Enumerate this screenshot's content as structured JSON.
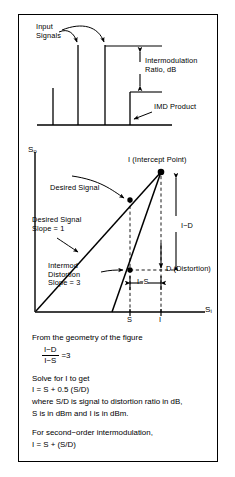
{
  "figure": {
    "ink_color": "#000000",
    "background_color": "#ffffff"
  },
  "spectrum_panel": {
    "name": "input spectrum with intermodulation products",
    "annotations": {
      "input_signals": "Input\nSignals",
      "intermodulation_ratio": "Intermodulation\nRatio, dB",
      "imd_product": "IMD Product"
    },
    "spikes": [
      {
        "label": "low-level spur",
        "relative_height": 0.36
      },
      {
        "label": "input signal 1",
        "relative_height": 0.93
      },
      {
        "label": "input signal 2",
        "relative_height": 0.93
      },
      {
        "label": "IMD product",
        "relative_height": 0.59
      }
    ]
  },
  "intercept_graph": {
    "name": "output vs input power intercept graph",
    "y_axis_label": "S",
    "y_axis_sub": "o",
    "x_axis_label": "S",
    "x_axis_sub": "i",
    "intercept_label": "I (Intercept Point)",
    "desired_signal_callout": "Desired Signal",
    "desired_signal_slope": "Desired Signal\nSlope = 1",
    "intermod_slope": "Intermod\nDistortion\nSlope = 3",
    "measure_i_minus_d": "I−D",
    "measure_i_minus_s": "I−S",
    "distortion_label": "D (Distortion)",
    "tick_s": "S",
    "tick_i": "I",
    "curves": [
      {
        "name": "desired signal",
        "slope": 1
      },
      {
        "name": "intermodulation distortion",
        "slope": 3
      }
    ]
  },
  "derivation": {
    "intro": "From the geometry of the figure",
    "fraction_numerator": "I−D",
    "fraction_denominator": "I−S",
    "fraction_equals": "=3",
    "solve_line": "Solve for I to get",
    "solve_equation": "I =  S + 0.5 (S/D)",
    "where_line_1": "where S/D is signal to distortion ratio in dB,",
    "where_line_2": "S is in dBm and I is in dBm.",
    "second_order_line": "For second−order intermodulation,",
    "second_order_equation": "I =  S + (S/D)"
  }
}
